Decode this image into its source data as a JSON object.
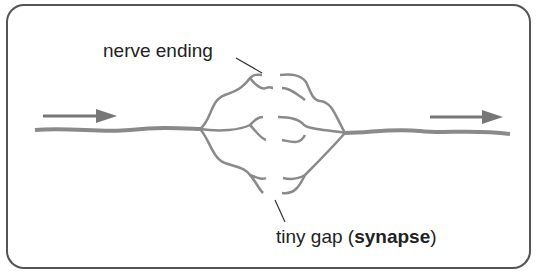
{
  "diagram": {
    "labels": {
      "nerve_ending": "nerve ending",
      "gap_prefix": "tiny gap (",
      "gap_term": "synapse",
      "gap_suffix": ")"
    },
    "arrows": [
      {
        "name": "input-arrow",
        "direction": "right"
      },
      {
        "name": "output-arrow",
        "direction": "right"
      }
    ],
    "colors": {
      "nerve": "#8a8a8a",
      "arrow": "#777777",
      "frame": "#555555",
      "text": "#222222"
    }
  }
}
